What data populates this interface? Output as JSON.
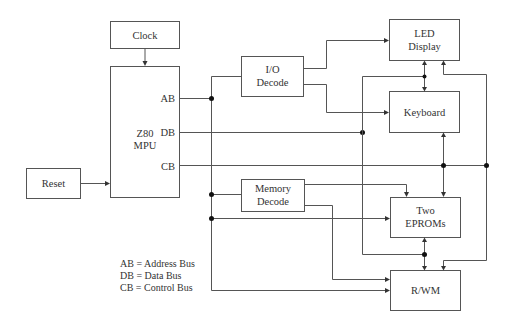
{
  "diagram": {
    "blocks": {
      "clock": {
        "label": "Clock"
      },
      "mpu": {
        "line1": "Z80",
        "line2": "MPU",
        "port_ab": "AB",
        "port_db": "DB",
        "port_cb": "CB"
      },
      "reset": {
        "label": "Reset"
      },
      "io_decode": {
        "line1": "I/O",
        "line2": "Decode"
      },
      "memory_decode": {
        "line1": "Memory",
        "line2": "Decode"
      },
      "led_display": {
        "line1": "LED",
        "line2": "Display"
      },
      "keyboard": {
        "label": "Keyboard"
      },
      "eproms": {
        "line1": "Two",
        "line2": "EPROMs"
      },
      "rwm": {
        "label": "R/WM"
      }
    },
    "legend": [
      {
        "abbr": "AB",
        "text": "AB = Address Bus"
      },
      {
        "abbr": "DB",
        "text": "DB = Data Bus"
      },
      {
        "abbr": "CB",
        "text": "CB = Control Bus"
      }
    ],
    "colors": {
      "line": "#555555",
      "text": "#333333",
      "background": "#ffffff"
    }
  }
}
